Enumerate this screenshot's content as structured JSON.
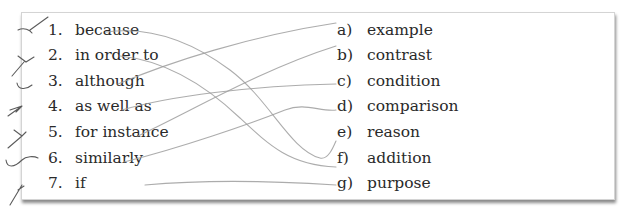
{
  "exercise": {
    "left_items": [
      {
        "num": "1.",
        "text": "because"
      },
      {
        "num": "2.",
        "text": "in order to"
      },
      {
        "num": "3.",
        "text": "although"
      },
      {
        "num": "4.",
        "text": "as well as"
      },
      {
        "num": "5.",
        "text": "for instance"
      },
      {
        "num": "6.",
        "text": "similarly"
      },
      {
        "num": "7.",
        "text": "if"
      }
    ],
    "right_items": [
      {
        "letter": "a)",
        "text": "example"
      },
      {
        "letter": "b)",
        "text": "contrast"
      },
      {
        "letter": "c)",
        "text": "condition"
      },
      {
        "letter": "d)",
        "text": "comparison"
      },
      {
        "letter": "e)",
        "text": "reason"
      },
      {
        "letter": "f)",
        "text": "addition"
      },
      {
        "letter": "g)",
        "text": "purpose"
      }
    ],
    "drawn_matches": [
      {
        "from": "1",
        "to": "e"
      },
      {
        "from": "2",
        "to": "f"
      },
      {
        "from": "3",
        "to": "a"
      },
      {
        "from": "4",
        "to": "c"
      },
      {
        "from": "5",
        "to": "b"
      },
      {
        "from": "6",
        "to": "d"
      },
      {
        "from": "7",
        "to": "g"
      }
    ],
    "pencil_color": "#9d9d9d",
    "check_marks_count": 7
  }
}
